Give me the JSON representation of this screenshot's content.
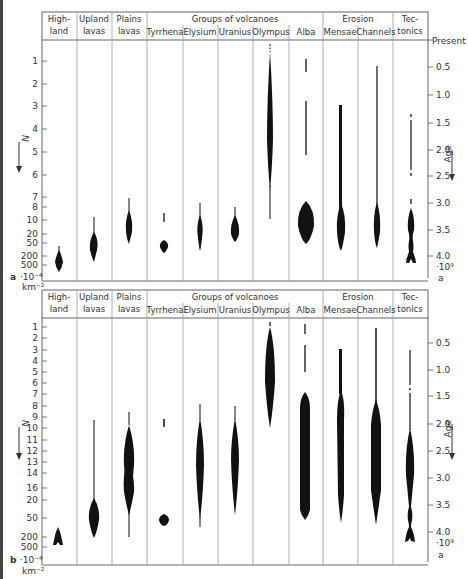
{
  "figure": {
    "columns": [
      {
        "id": "highland",
        "line1": "High-",
        "line2": "land"
      },
      {
        "id": "upland",
        "line1": "Upland",
        "line2": "lavas"
      },
      {
        "id": "plains",
        "line1": "Plains",
        "line2": "lavas"
      },
      {
        "id": "tyrrhena",
        "line1": "",
        "line2": "Tyrrhena"
      },
      {
        "id": "elysium",
        "line1": "",
        "line2": "Elysium"
      },
      {
        "id": "uranius",
        "line1": "",
        "line2": "Uranius"
      },
      {
        "id": "olympus",
        "line1": "",
        "line2": "Olympus"
      },
      {
        "id": "alba",
        "line1": "",
        "line2": "Alba"
      },
      {
        "id": "mensae",
        "line1": "",
        "line2": "Mensae"
      },
      {
        "id": "channels",
        "line1": "",
        "line2": "Channels"
      },
      {
        "id": "tectonics",
        "line1": "Tec-",
        "line2": "tonics"
      }
    ],
    "group_volcanoes": "Groups of volcanoes",
    "group_erosion": "Erosion",
    "left_axis_title": "N",
    "left_axis_unit_1": "·10⁻⁴",
    "left_axis_unit_2": "km⁻²",
    "right_axis_title": "Age",
    "right_axis_top": "Present",
    "right_axis_unit_1": "·10⁹",
    "right_axis_unit_2": "a"
  },
  "panel_a": {
    "label": "a",
    "left_ticks": [
      "1",
      "2",
      "3",
      "4",
      "5",
      "6",
      "7",
      "8",
      "10",
      "20",
      "50",
      "200",
      "500"
    ],
    "right_ticks": [
      "0.5",
      "1.0",
      "1.5",
      "2.0",
      "2.5",
      "3.0",
      "3.5",
      "4.0"
    ]
  },
  "panel_b": {
    "label": "b",
    "left_ticks": [
      "1",
      "2",
      "3",
      "4",
      "5",
      "6",
      "7",
      "8",
      "9",
      "10",
      "11",
      "12",
      "13",
      "14",
      "16",
      "20",
      "50",
      "200",
      "500"
    ],
    "right_ticks": [
      "0.5",
      "1.0",
      "1.5",
      "2.0",
      "2.5",
      "3.0",
      "3.5",
      "4.0"
    ]
  }
}
